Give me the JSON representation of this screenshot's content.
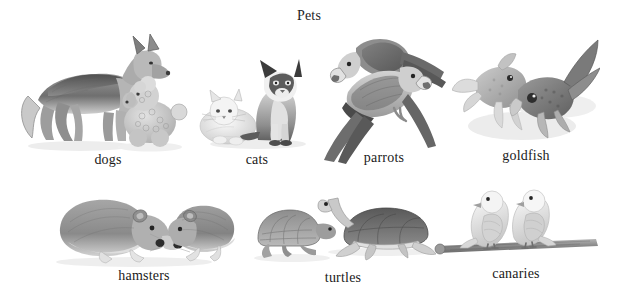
{
  "figure": {
    "title": "Pets",
    "type": "pictorial-vocabulary-chart",
    "background_color": "#ffffff",
    "text_color": "#1a1a1a",
    "illustration_style": "grayscale pencil/wash drawings"
  },
  "rows": [
    {
      "row": 1,
      "items": [
        {
          "id": "dogs",
          "label": "dogs",
          "count": 2,
          "subjects": "german shepherd and poodle"
        },
        {
          "id": "cats",
          "label": "cats",
          "count": 2,
          "subjects": "white longhair cat and siamese cat"
        },
        {
          "id": "parrots",
          "label": "parrots",
          "count": 2,
          "subjects": "two long-tailed parrots on a perch"
        },
        {
          "id": "goldfish",
          "label": "goldfish",
          "count": 2,
          "subjects": "two fantail goldfish"
        }
      ]
    },
    {
      "row": 2,
      "items": [
        {
          "id": "hamsters",
          "label": "hamsters",
          "count": 2,
          "subjects": "two hamsters facing each other"
        },
        {
          "id": "turtles",
          "label": "turtles",
          "count": 2,
          "subjects": "a tortoise and a pond turtle"
        },
        {
          "id": "canaries",
          "label": "canaries",
          "count": 2,
          "subjects": "two canaries on a wooden perch"
        }
      ]
    }
  ],
  "palette": {
    "ink_dark": "#3a3a3a",
    "ink_mid": "#7d7d7d",
    "ink_light": "#b9b9b9",
    "wash": "#d8d8d8",
    "shadow": "#e3e3e3"
  }
}
